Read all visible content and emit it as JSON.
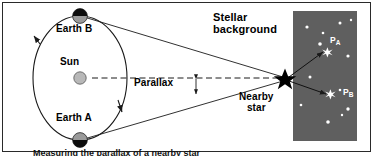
{
  "figure": {
    "caption_partial": "Measuring the parallax of a nearby star",
    "border_color": "#2a2a2a",
    "background": "#ffffff"
  },
  "labels": {
    "earth_b": "Earth B",
    "sun": "Sun",
    "earth_a": "Earth A",
    "parallax": "Parallax",
    "stellar_background": "Stellar\nbackground",
    "nearby_star": "Nearby\nstar",
    "position_a": "P",
    "position_a_sub": "A",
    "position_b": "P",
    "position_b_sub": "B"
  },
  "colors": {
    "line": "#1a1a1a",
    "sun_fill": "#b8b8b8",
    "earth_light": "#9a9a9a",
    "earth_dark": "#0d0d0d",
    "starfield_bg": "#5f5f5f",
    "star_white": "#ffffff",
    "nearby_star_fill": "#000000"
  },
  "geometry": {
    "orbit_center_x": 80,
    "orbit_center_y": 78,
    "orbit_rx": 47,
    "orbit_ry": 62,
    "earth_b_x": 80,
    "earth_b_y": 16,
    "earth_a_x": 80,
    "earth_a_y": 140,
    "sun_x": 80,
    "sun_y": 78,
    "star_x": 285,
    "star_y": 79,
    "panel_x": 293,
    "panel_y": 11,
    "panel_w": 64,
    "panel_h": 130
  },
  "starfield": {
    "background_stars": [
      {
        "x": 14,
        "y": 16,
        "r": 1.6
      },
      {
        "x": 30,
        "y": 22,
        "r": 1.3
      },
      {
        "x": 47,
        "y": 12,
        "r": 1.5
      },
      {
        "x": 58,
        "y": 9,
        "r": 1.2
      },
      {
        "x": 27,
        "y": 33,
        "r": 1.8
      },
      {
        "x": 55,
        "y": 45,
        "r": 1.6
      },
      {
        "x": 17,
        "y": 66,
        "r": 1.5
      },
      {
        "x": 47,
        "y": 79,
        "r": 1.3
      },
      {
        "x": 55,
        "y": 98,
        "r": 1.7
      },
      {
        "x": 35,
        "y": 111,
        "r": 1.8
      },
      {
        "x": 49,
        "y": 104,
        "r": 1.2
      },
      {
        "x": 8,
        "y": 94,
        "r": 1.3
      }
    ],
    "target_star_a": {
      "x": 33,
      "y": 45,
      "r": 4.6
    },
    "target_star_b": {
      "x": 36,
      "y": 87,
      "r": 4.6
    }
  }
}
